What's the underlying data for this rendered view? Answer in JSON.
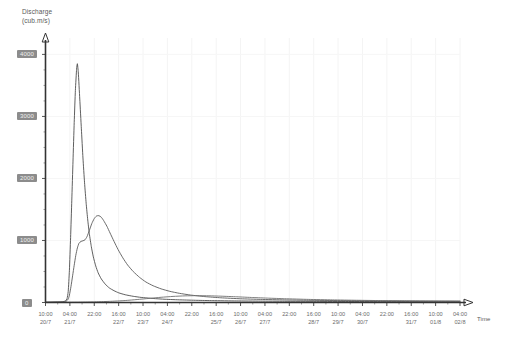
{
  "chart_data": {
    "type": "line",
    "title": "",
    "ylabel": "Discharge\n(cub.m/s)",
    "ylabel_line1": "Discharge",
    "ylabel_line2": "(cub.m/s)",
    "xlabel": "Time",
    "ylim": [
      0,
      4200
    ],
    "yticks": [
      0,
      1000,
      2000,
      3000,
      4000
    ],
    "ytick_labels": [
      "0",
      "1000",
      "2000",
      "3000",
      "4000"
    ],
    "grid": true,
    "legend": "none",
    "x_tick_labels": [
      {
        "time": "10:00",
        "date": "20/7"
      },
      {
        "time": "04:00",
        "date": "21/7"
      },
      {
        "time": "22:00",
        "date": ""
      },
      {
        "time": "16:00",
        "date": "22/7"
      },
      {
        "time": "10:00",
        "date": "23/7"
      },
      {
        "time": "04:00",
        "date": "24/7"
      },
      {
        "time": "22:00",
        "date": ""
      },
      {
        "time": "16:00",
        "date": "25/7"
      },
      {
        "time": "10:00",
        "date": "26/7"
      },
      {
        "time": "04:00",
        "date": "27/7"
      },
      {
        "time": "22:00",
        "date": ""
      },
      {
        "time": "16:00",
        "date": "28/7"
      },
      {
        "time": "10:00",
        "date": "29/7"
      },
      {
        "time": "04:00",
        "date": "30/7"
      },
      {
        "time": "22:00",
        "date": ""
      },
      {
        "time": "16:00",
        "date": "31/7"
      },
      {
        "time": "10:00",
        "date": "01/8"
      },
      {
        "time": "04:00",
        "date": "02/8"
      }
    ],
    "series": [
      {
        "name": "sharp-peak-hydrograph",
        "color": "#4d4d4d",
        "peak_value": 3850,
        "peak_time": "22:00 22/7",
        "points": [
          [
            0,
            5
          ],
          [
            0.6,
            6
          ],
          [
            1.2,
            8
          ],
          [
            1.8,
            10
          ],
          [
            2.2,
            14
          ],
          [
            2.5,
            25
          ],
          [
            2.7,
            60
          ],
          [
            2.85,
            180
          ],
          [
            3.0,
            520
          ],
          [
            3.15,
            1050
          ],
          [
            3.3,
            1650
          ],
          [
            3.45,
            2280
          ],
          [
            3.6,
            2900
          ],
          [
            3.75,
            3420
          ],
          [
            3.9,
            3760
          ],
          [
            4.0,
            3850
          ],
          [
            4.12,
            3700
          ],
          [
            4.3,
            3280
          ],
          [
            4.5,
            2800
          ],
          [
            4.7,
            2330
          ],
          [
            4.9,
            1930
          ],
          [
            5.1,
            1600
          ],
          [
            5.3,
            1330
          ],
          [
            5.5,
            1110
          ],
          [
            5.75,
            900
          ],
          [
            6.0,
            735
          ],
          [
            6.3,
            590
          ],
          [
            6.6,
            480
          ],
          [
            7.0,
            380
          ],
          [
            7.5,
            295
          ],
          [
            8.0,
            235
          ],
          [
            8.6,
            190
          ],
          [
            9.2,
            155
          ],
          [
            10.0,
            125
          ],
          [
            11.0,
            100
          ],
          [
            12.0,
            82
          ],
          [
            13.5,
            65
          ],
          [
            15.0,
            52
          ],
          [
            17.0,
            42
          ],
          [
            19.0,
            35
          ],
          [
            21.0,
            30
          ],
          [
            24.0,
            25
          ],
          [
            27.0,
            22
          ],
          [
            30.0,
            20
          ],
          [
            34.0,
            18
          ],
          [
            38.0,
            16
          ],
          [
            42.0,
            15
          ],
          [
            46.0,
            14
          ],
          [
            50.0,
            13
          ],
          [
            52.0,
            13
          ]
        ]
      },
      {
        "name": "broad-peak-hydrograph",
        "color": "#5a5a5a",
        "peak_value": 1400,
        "peak_time": "16:00 23/7",
        "points": [
          [
            0,
            4
          ],
          [
            0.8,
            5
          ],
          [
            1.6,
            7
          ],
          [
            2.2,
            10
          ],
          [
            2.6,
            20
          ],
          [
            2.85,
            55
          ],
          [
            3.0,
            120
          ],
          [
            3.2,
            260
          ],
          [
            3.4,
            430
          ],
          [
            3.6,
            600
          ],
          [
            3.8,
            760
          ],
          [
            4.0,
            880
          ],
          [
            4.2,
            955
          ],
          [
            4.45,
            985
          ],
          [
            4.7,
            995
          ],
          [
            4.95,
            1010
          ],
          [
            5.2,
            1060
          ],
          [
            5.5,
            1160
          ],
          [
            5.8,
            1270
          ],
          [
            6.1,
            1350
          ],
          [
            6.4,
            1395
          ],
          [
            6.7,
            1400
          ],
          [
            7.0,
            1375
          ],
          [
            7.3,
            1320
          ],
          [
            7.7,
            1230
          ],
          [
            8.1,
            1120
          ],
          [
            8.6,
            985
          ],
          [
            9.1,
            855
          ],
          [
            9.7,
            720
          ],
          [
            10.3,
            605
          ],
          [
            11.0,
            500
          ],
          [
            11.8,
            405
          ],
          [
            12.6,
            330
          ],
          [
            13.5,
            270
          ],
          [
            14.5,
            220
          ],
          [
            15.6,
            180
          ],
          [
            16.8,
            148
          ],
          [
            18.2,
            120
          ],
          [
            20.0,
            95
          ],
          [
            22.0,
            76
          ],
          [
            24.5,
            60
          ],
          [
            27.0,
            50
          ],
          [
            30.0,
            42
          ],
          [
            33.0,
            36
          ],
          [
            37.0,
            31
          ],
          [
            41.0,
            27
          ],
          [
            45.0,
            24
          ],
          [
            49.0,
            22
          ],
          [
            52.0,
            21
          ]
        ]
      },
      {
        "name": "baseline-hydrograph",
        "color": "#6f6f6f",
        "peak_value": 110,
        "peak_time": "16:00 25/7",
        "points": [
          [
            0,
            3
          ],
          [
            2,
            4
          ],
          [
            4,
            6
          ],
          [
            6,
            10
          ],
          [
            8,
            18
          ],
          [
            10,
            32
          ],
          [
            11.5,
            48
          ],
          [
            13,
            66
          ],
          [
            14.5,
            84
          ],
          [
            16,
            98
          ],
          [
            17.5,
            107
          ],
          [
            19,
            110
          ],
          [
            20.5,
            108
          ],
          [
            22,
            102
          ],
          [
            24,
            92
          ],
          [
            26,
            80
          ],
          [
            28,
            70
          ],
          [
            30,
            61
          ],
          [
            33,
            50
          ],
          [
            36,
            42
          ],
          [
            39,
            36
          ],
          [
            42,
            31
          ],
          [
            45,
            27
          ],
          [
            48,
            24
          ],
          [
            52,
            22
          ]
        ]
      }
    ]
  },
  "axes": {
    "y_axis_name": "discharge-axis",
    "x_axis_name": "time-axis"
  }
}
